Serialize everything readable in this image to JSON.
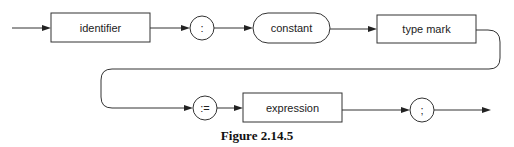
{
  "diagram": {
    "type": "syntax-diagram",
    "nodes": [
      {
        "id": "identifier",
        "label": "identifier",
        "shape": "rectangle"
      },
      {
        "id": "colon",
        "label": ":",
        "shape": "circle"
      },
      {
        "id": "constant",
        "label": "constant",
        "shape": "rounded"
      },
      {
        "id": "type_mark",
        "label": "type mark",
        "shape": "rectangle"
      },
      {
        "id": "assign",
        "label": ":=",
        "shape": "circle"
      },
      {
        "id": "expression",
        "label": "expression",
        "shape": "rectangle"
      },
      {
        "id": "semicolon",
        "label": ";",
        "shape": "circle"
      }
    ],
    "edges": [
      [
        "start",
        "identifier"
      ],
      [
        "identifier",
        "colon"
      ],
      [
        "colon",
        "constant"
      ],
      [
        "constant",
        "type_mark"
      ],
      [
        "type_mark",
        "assign"
      ],
      [
        "assign",
        "expression"
      ],
      [
        "expression",
        "semicolon"
      ],
      [
        "semicolon",
        "end"
      ]
    ]
  },
  "labels": {
    "identifier": "identifier",
    "colon": ":",
    "constant": "constant",
    "type_mark": "type mark",
    "assign": ":=",
    "expression": "expression",
    "semicolon": ";"
  },
  "caption": "Figure 2.14.5"
}
